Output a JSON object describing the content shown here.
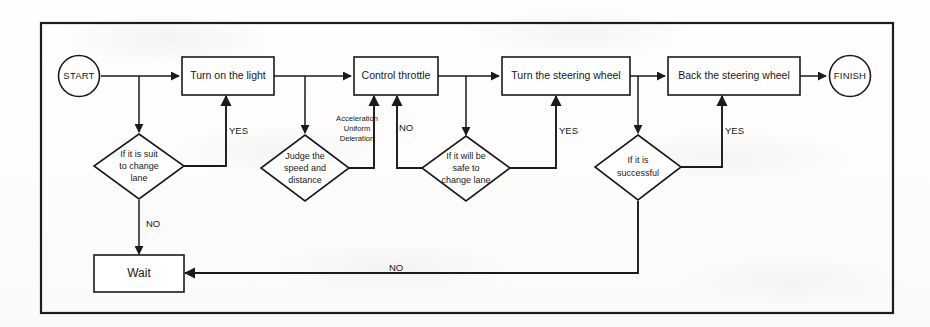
{
  "diagram": {
    "colors": {
      "stroke": "#1a1a1a",
      "fill": "#ffffff",
      "page": "#fdfdfc"
    },
    "terminators": {
      "start": "START",
      "finish": "FINISH"
    },
    "processes": {
      "turn_on_light": "Turn on the light",
      "control_throttle": "Control throttle",
      "turn_steering": "Turn the steering wheel",
      "back_steering": "Back the steering wheel",
      "wait": "Wait"
    },
    "decisions": {
      "suit_to_change_lane": {
        "line1": "If it is suit",
        "line2": "to  change",
        "line3": "lane"
      },
      "judge_speed_distance": {
        "line1": "Judge the",
        "line2": "speed and",
        "line3": "distance"
      },
      "safe_to_change_lane": {
        "line1": "If it will be",
        "line2": "safe to",
        "line3": "change lane"
      },
      "is_successful": {
        "line1": "If it is",
        "line2": "successful"
      }
    },
    "annotations": {
      "throttle_note": {
        "line1": "Acceleration",
        "line2": "Uniform",
        "line3": "Deleration"
      }
    },
    "edge_labels": {
      "yes_1": "YES",
      "yes_2": "YES",
      "yes_3": "YES",
      "no_1": "NO",
      "no_2": "NO",
      "no_3": "NO"
    }
  }
}
